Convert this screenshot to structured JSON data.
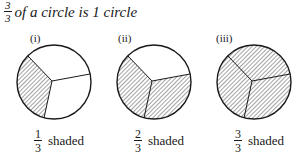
{
  "title": {
    "fraction": {
      "numerator": "3",
      "denominator": "3"
    },
    "text": "of a circle is 1 circle"
  },
  "panels": [
    {
      "label": "(i)",
      "shaded_sectors": 1,
      "total_sectors": 3,
      "caption": {
        "numerator": "1",
        "denominator": "3",
        "text": "shaded"
      }
    },
    {
      "label": "(ii)",
      "shaded_sectors": 2,
      "total_sectors": 3,
      "caption": {
        "numerator": "2",
        "denominator": "3",
        "text": "shaded"
      }
    },
    {
      "label": "(iii)",
      "shaded_sectors": 3,
      "total_sectors": 3,
      "caption": {
        "numerator": "3",
        "denominator": "3",
        "text": "shaded"
      }
    }
  ],
  "colors": {
    "ink": "#1a1a1a",
    "background": "#ffffff"
  }
}
